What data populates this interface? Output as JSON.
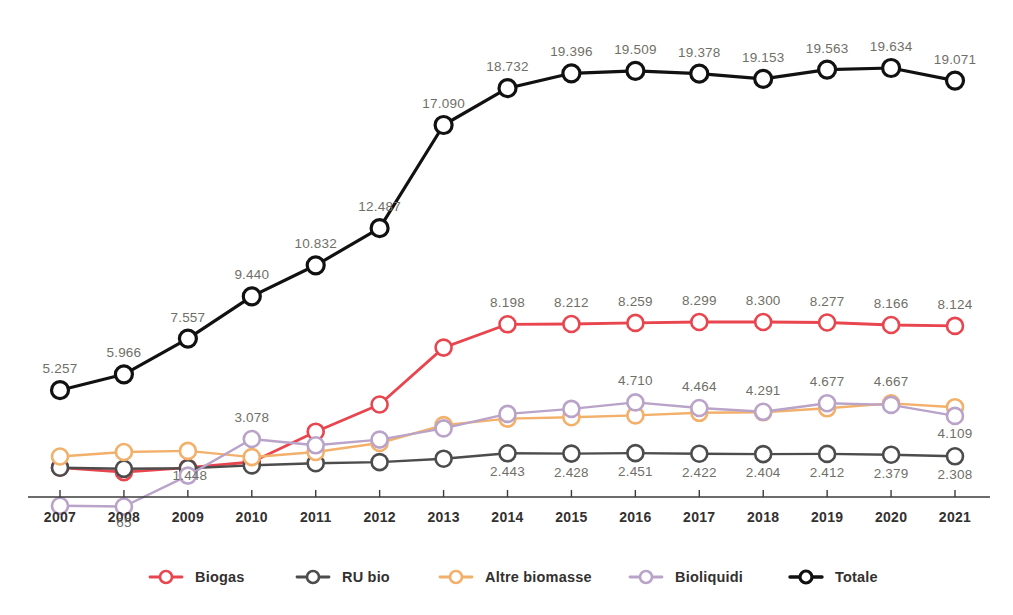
{
  "chart_data": {
    "type": "line",
    "title": "",
    "xlabel": "",
    "ylabel": "",
    "grid": false,
    "legend_position": "bottom",
    "xlim": [
      2007,
      2021
    ],
    "ylim": [
      0,
      20000
    ],
    "categories": [
      "2007",
      "2008",
      "2009",
      "2010",
      "2011",
      "2012",
      "2013",
      "2014",
      "2015",
      "2016",
      "2017",
      "2018",
      "2019",
      "2020",
      "2021"
    ],
    "series": [
      {
        "name": "Biogas",
        "color": "#e8454e",
        "values": [
          1800,
          1600,
          1800,
          2054,
          3405,
          4618,
          7158,
          8198,
          8212,
          8259,
          8299,
          8300,
          8277,
          8166,
          8124
        ],
        "labels": [
          "",
          "",
          "",
          "",
          "",
          "",
          "",
          "8.198",
          "8.212",
          "8.259",
          "8.299",
          "8.300",
          "8.277",
          "8.166",
          "8.124"
        ]
      },
      {
        "name": "RU bio",
        "color": "#4c4c4c",
        "values": [
          1800,
          1750,
          1770,
          1900,
          2000,
          2050,
          2200,
          2443,
          2428,
          2451,
          2422,
          2404,
          2412,
          2379,
          2308
        ],
        "labels": [
          "",
          "",
          "",
          "",
          "",
          "",
          "",
          "2.443",
          "2.428",
          "2.451",
          "2.422",
          "2.404",
          "2.412",
          "2.379",
          "2.308"
        ]
      },
      {
        "name": "Altre biomasse",
        "color": "#f2b06a",
        "values": [
          2300,
          2500,
          2550,
          2270,
          2500,
          2900,
          3700,
          3990,
          4050,
          4130,
          4250,
          4270,
          4450,
          4667,
          4500
        ],
        "labels": [
          "",
          "",
          "",
          "",
          "",
          "",
          "",
          "",
          "",
          "",
          "",
          "",
          "",
          "4.667",
          ""
        ]
      },
      {
        "name": "Bioliquidi",
        "color": "#b9a3c8",
        "values": [
          100,
          65,
          1448,
          3078,
          2800,
          3050,
          3550,
          4200,
          4420,
          4710,
          4464,
          4291,
          4677,
          4600,
          4109
        ],
        "labels": [
          "",
          "65",
          "1.448",
          "3.078",
          "",
          "",
          "",
          "",
          "",
          "4.710",
          "4.464",
          "4.291",
          "4.677",
          "",
          "4.109"
        ]
      },
      {
        "name": "Totale",
        "color": "#111111",
        "values": [
          5257,
          5966,
          7557,
          9440,
          10832,
          12487,
          17090,
          18732,
          19396,
          19509,
          19378,
          19153,
          19563,
          19634,
          19071
        ],
        "labels": [
          "5.257",
          "5.966",
          "7.557",
          "9.440",
          "10.832",
          "12.487",
          "17.090",
          "18.732",
          "19.396",
          "19.509",
          "19.378",
          "19.153",
          "19.563",
          "19.634",
          "19.071"
        ]
      }
    ]
  },
  "axis": {
    "years": [
      "2007",
      "2008",
      "2009",
      "2010",
      "2011",
      "2012",
      "2013",
      "2014",
      "2015",
      "2016",
      "2017",
      "2018",
      "2019",
      "2020",
      "2021"
    ]
  },
  "legend": {
    "items": [
      {
        "label": "Biogas",
        "color": "#e8454e"
      },
      {
        "label": "RU bio",
        "color": "#4c4c4c"
      },
      {
        "label": "Altre biomasse",
        "color": "#f2b06a"
      },
      {
        "label": "Bioliquidi",
        "color": "#b9a3c8"
      },
      {
        "label": "Totale",
        "color": "#111111"
      }
    ]
  }
}
